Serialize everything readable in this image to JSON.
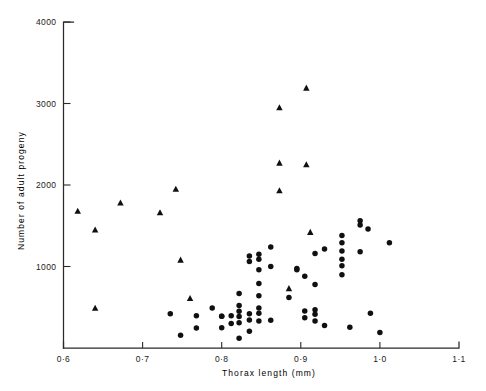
{
  "chart_data": {
    "type": "scatter",
    "title": "",
    "xlabel": "Thorax  length  (mm)",
    "ylabel": "Number of  adult  progeny",
    "xlim": [
      0.6,
      1.1
    ],
    "ylim": [
      0,
      4000
    ],
    "xticks": [
      0.6,
      0.7,
      0.8,
      0.9,
      1.0,
      1.1
    ],
    "xtick_labels": [
      "0·6",
      "0·7",
      "0·8",
      "0·9",
      "1·0",
      "1·1"
    ],
    "yticks": [
      1000,
      2000,
      3000,
      4000
    ],
    "ytick_labels": [
      "1000",
      "2000",
      "3000",
      "4000"
    ],
    "grid": false,
    "legend": false,
    "marker_color": "#101010",
    "axis_color": "#2a2a2a",
    "series": [
      {
        "name": "triangle-group",
        "marker": "triangle",
        "points": [
          [
            0.618,
            1680
          ],
          [
            0.64,
            1450
          ],
          [
            0.64,
            490
          ],
          [
            0.672,
            1780
          ],
          [
            0.722,
            1660
          ],
          [
            0.742,
            1950
          ],
          [
            0.748,
            1080
          ],
          [
            0.76,
            610
          ],
          [
            0.873,
            2950
          ],
          [
            0.873,
            2270
          ],
          [
            0.873,
            1930
          ],
          [
            0.885,
            730
          ],
          [
            0.907,
            3190
          ],
          [
            0.907,
            2250
          ],
          [
            0.912,
            1420
          ]
        ]
      },
      {
        "name": "circle-group",
        "marker": "circle",
        "points": [
          [
            0.735,
            420
          ],
          [
            0.748,
            155
          ],
          [
            0.768,
            395
          ],
          [
            0.768,
            245
          ],
          [
            0.788,
            490
          ],
          [
            0.8,
            390
          ],
          [
            0.8,
            390
          ],
          [
            0.8,
            250
          ],
          [
            0.812,
            395
          ],
          [
            0.812,
            300
          ],
          [
            0.822,
            670
          ],
          [
            0.822,
            520
          ],
          [
            0.822,
            450
          ],
          [
            0.822,
            385
          ],
          [
            0.822,
            310
          ],
          [
            0.822,
            120
          ],
          [
            0.835,
            1130
          ],
          [
            0.835,
            1060
          ],
          [
            0.835,
            420
          ],
          [
            0.835,
            345
          ],
          [
            0.835,
            205
          ],
          [
            0.847,
            1150
          ],
          [
            0.847,
            1090
          ],
          [
            0.847,
            960
          ],
          [
            0.847,
            790
          ],
          [
            0.847,
            640
          ],
          [
            0.847,
            490
          ],
          [
            0.847,
            425
          ],
          [
            0.847,
            330
          ],
          [
            0.862,
            1240
          ],
          [
            0.862,
            1000
          ],
          [
            0.862,
            340
          ],
          [
            0.885,
            620
          ],
          [
            0.895,
            975
          ],
          [
            0.895,
            960
          ],
          [
            0.905,
            880
          ],
          [
            0.905,
            455
          ],
          [
            0.905,
            370
          ],
          [
            0.918,
            1160
          ],
          [
            0.918,
            780
          ],
          [
            0.918,
            470
          ],
          [
            0.918,
            415
          ],
          [
            0.918,
            330
          ],
          [
            0.93,
            1215
          ],
          [
            0.93,
            275
          ],
          [
            0.952,
            1380
          ],
          [
            0.952,
            1290
          ],
          [
            0.952,
            1190
          ],
          [
            0.952,
            1090
          ],
          [
            0.952,
            1010
          ],
          [
            0.952,
            900
          ],
          [
            0.962,
            255
          ],
          [
            0.975,
            1560
          ],
          [
            0.975,
            1510
          ],
          [
            0.975,
            1180
          ],
          [
            0.985,
            1460
          ],
          [
            0.988,
            425
          ],
          [
            1.0,
            190
          ],
          [
            1.012,
            1290
          ]
        ]
      }
    ]
  },
  "axis": {
    "x_label": "Thorax  length  (mm)",
    "y_label": "Number of  adult  progeny"
  }
}
